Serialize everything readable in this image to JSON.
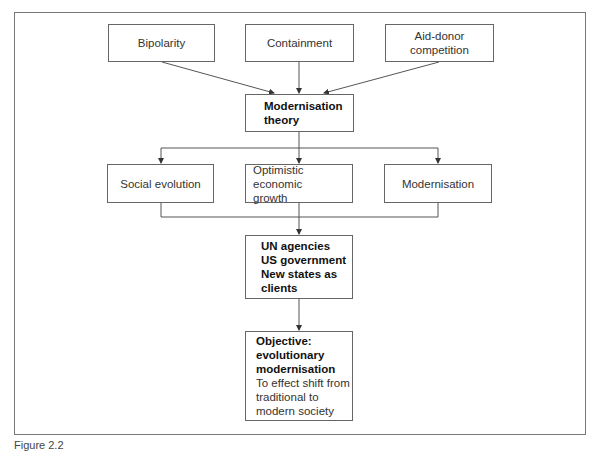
{
  "diagram": {
    "top_row": [
      {
        "id": "bipolarity",
        "label": "Bipolarity"
      },
      {
        "id": "containment",
        "label": "Containment"
      },
      {
        "id": "aid-donor",
        "label": "Aid-donor competition",
        "lines": [
          "Aid-donor",
          "competition"
        ]
      }
    ],
    "central": {
      "id": "modernisation-theory",
      "lines": [
        "Modernisation",
        "theory"
      ]
    },
    "middle_row": [
      {
        "id": "social-evolution",
        "label": "Social evolution"
      },
      {
        "id": "optimistic-growth",
        "lines": [
          "Optimistic economic",
          "growth"
        ]
      },
      {
        "id": "modernisation",
        "label": "Modernisation"
      }
    ],
    "actors": {
      "id": "actors",
      "lines": [
        "UN agencies",
        "US government",
        "New states as",
        "clients"
      ]
    },
    "objective": {
      "id": "objective",
      "bold_lines": [
        "Objective:",
        "evolutionary",
        "modernisation"
      ],
      "lines": [
        "To effect shift from",
        "traditional to",
        "modern society"
      ]
    },
    "edges": [
      [
        "bipolarity",
        "modernisation-theory"
      ],
      [
        "containment",
        "modernisation-theory"
      ],
      [
        "aid-donor",
        "modernisation-theory"
      ],
      [
        "modernisation-theory",
        "social-evolution"
      ],
      [
        "modernisation-theory",
        "optimistic-growth"
      ],
      [
        "modernisation-theory",
        "modernisation"
      ],
      [
        "social-evolution",
        "actors"
      ],
      [
        "optimistic-growth",
        "actors"
      ],
      [
        "modernisation",
        "actors"
      ],
      [
        "actors",
        "objective"
      ]
    ]
  },
  "caption": "Figure 2.2"
}
